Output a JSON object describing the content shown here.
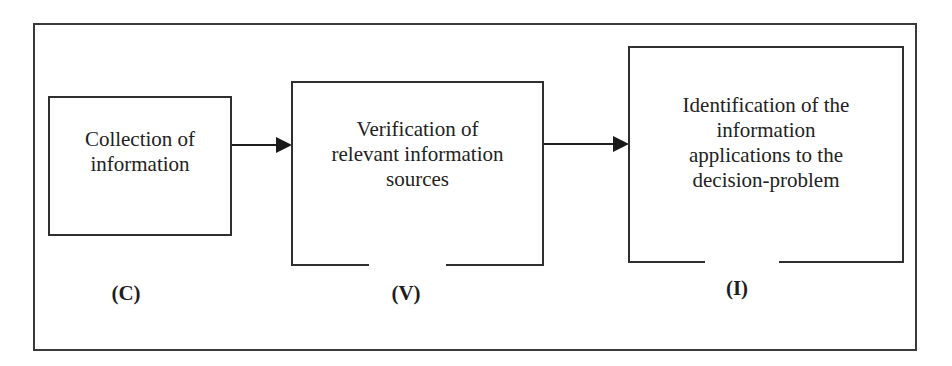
{
  "diagram": {
    "type": "process-flow",
    "steps": [
      {
        "id": "C",
        "text": "Collection of\ninformation",
        "label": "(C)"
      },
      {
        "id": "V",
        "text": "Verification of\nrelevant information\nsources",
        "label": "(V)"
      },
      {
        "id": "I",
        "text": "Identification of the\ninformation\napplications to the\ndecision-problem",
        "label": "(I)"
      }
    ],
    "connections": [
      {
        "from": "C",
        "to": "V"
      },
      {
        "from": "V",
        "to": "I"
      }
    ]
  }
}
